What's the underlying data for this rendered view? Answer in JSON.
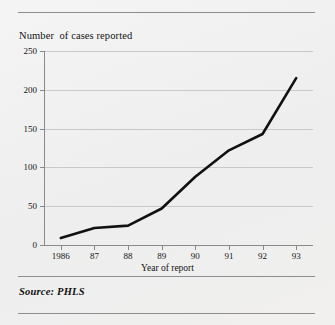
{
  "figure": {
    "title": "Number  of cases reported",
    "source_note": "Source: PHLS",
    "rules": [
      "top-rule",
      "mid-rule",
      "bottom-rule"
    ]
  },
  "chart_data": {
    "type": "line",
    "title": "Number  of cases reported",
    "xlabel": "Year of report",
    "ylabel": "",
    "categories": [
      "1986",
      "87",
      "88",
      "89",
      "90",
      "91",
      "92",
      "93"
    ],
    "values": [
      9,
      22,
      25,
      47,
      88,
      122,
      143,
      215
    ],
    "series": [
      {
        "name": "Number of cases reported",
        "values": [
          9,
          22,
          25,
          47,
          88,
          122,
          143,
          215
        ],
        "color": "#111111"
      }
    ],
    "ylim": [
      0,
      250
    ],
    "yticks": [
      0,
      50,
      100,
      150,
      200,
      250
    ],
    "ytick_labels": [
      "0",
      "50",
      "100",
      "150",
      "200",
      "250"
    ],
    "xtick_labels": [
      "1986",
      "87",
      "88",
      "89",
      "90",
      "91",
      "92",
      "93"
    ],
    "grid": "horizontal",
    "legend": "none",
    "line_color": "#111111",
    "grid_color": "#c9c9c9",
    "axis_color": "#8a8a8a"
  }
}
